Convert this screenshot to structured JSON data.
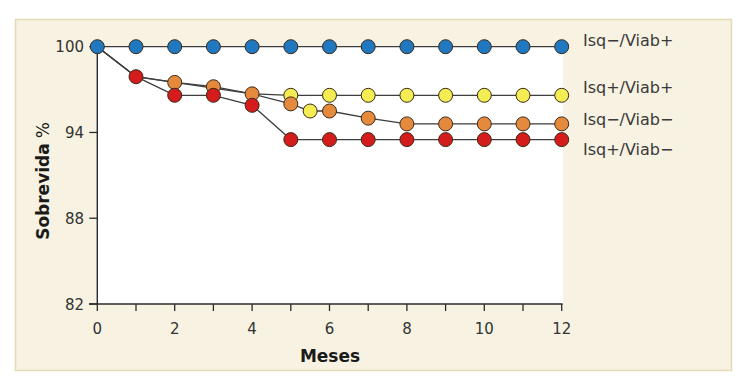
{
  "chart_data": {
    "type": "line",
    "title": "",
    "xlabel": "Meses",
    "ylabel": "Sobrevida",
    "ylabel_unit": "%",
    "xlim": [
      0,
      12
    ],
    "ylim": [
      82,
      100
    ],
    "xticks": [
      0,
      2,
      4,
      6,
      8,
      10,
      12
    ],
    "xtick_labels": [
      "0",
      "2",
      "4",
      "6",
      "8",
      "10",
      "12"
    ],
    "yticks": [
      82,
      88,
      94,
      100
    ],
    "ytick_labels": [
      "82",
      "88",
      "94",
      "100"
    ],
    "grid": false,
    "legend_placement": "right (labels at line ends)",
    "colors": {
      "blue": "#1f78c0",
      "yellow": "#f3ec52",
      "orange": "#e58a3c",
      "red": "#d41c1c",
      "line": "#3d3d3d",
      "marker_edge": "#3a2a1a",
      "panel_background": "#f7f2e1",
      "plot_background": "#ffffff"
    },
    "series": [
      {
        "name": "Isq−/Viab+",
        "color": "blue",
        "x": [
          0,
          1,
          2,
          3,
          4,
          5,
          6,
          7,
          8,
          9,
          10,
          11,
          12
        ],
        "y": [
          100,
          100,
          100,
          100,
          100,
          100,
          100,
          100,
          100,
          100,
          100,
          100,
          100
        ],
        "markers": [
          "blue",
          "blue",
          "blue",
          "blue",
          "blue",
          "blue",
          "blue",
          "blue",
          "blue",
          "blue",
          "blue",
          "blue",
          "blue"
        ]
      },
      {
        "name": "Isq+/Viab+",
        "color": "yellow",
        "x": [
          0,
          1,
          2,
          3,
          4,
          5,
          6,
          7,
          8,
          9,
          10,
          11,
          12
        ],
        "y": [
          100,
          97.9,
          97.5,
          97.2,
          96.7,
          96.6,
          96.6,
          96.6,
          96.6,
          96.6,
          96.6,
          96.6,
          96.6
        ],
        "markers": [
          null,
          null,
          "orange",
          "orange",
          "orange",
          "yellow",
          "yellow",
          "yellow",
          "yellow",
          "yellow",
          "yellow",
          "yellow",
          "yellow"
        ]
      },
      {
        "name": "Isq−/Viab−",
        "color": "orange",
        "x": [
          0,
          1,
          2,
          4,
          5,
          5.5,
          6,
          7,
          8,
          9,
          10,
          11,
          12
        ],
        "y": [
          100,
          97.9,
          97.5,
          96.7,
          96.0,
          95.5,
          95.5,
          95.0,
          94.6,
          94.6,
          94.6,
          94.6,
          94.6
        ],
        "markers": [
          null,
          null,
          null,
          null,
          "orange",
          "yellow",
          "orange",
          "orange",
          "orange",
          "orange",
          "orange",
          "orange",
          "orange"
        ]
      },
      {
        "name": "Isq+/Viab−",
        "color": "red",
        "x": [
          0,
          1,
          2,
          3,
          4,
          5,
          6,
          7,
          8,
          9,
          10,
          11,
          12
        ],
        "y": [
          100,
          97.9,
          96.6,
          96.6,
          95.9,
          93.5,
          93.5,
          93.5,
          93.5,
          93.5,
          93.5,
          93.5,
          93.5
        ],
        "markers": [
          null,
          "red",
          "red",
          "red",
          "red",
          "red",
          "red",
          "red",
          "red",
          "red",
          "red",
          "red",
          "red"
        ]
      }
    ]
  }
}
